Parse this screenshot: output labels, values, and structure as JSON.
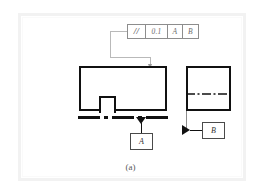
{
  "figure": {
    "caption": "(a)",
    "background_color": "#ffffff",
    "line_color": "#111111",
    "frame_color": "#f2f2f2"
  },
  "feature_control_frame": {
    "name": "parallelism-feature-control-frame",
    "cells": [
      {
        "key": "symbol",
        "label": "//",
        "icon": "parallelism-symbol"
      },
      {
        "key": "tolerance",
        "label": "0.1",
        "icon": "tolerance-value"
      },
      {
        "key": "primary_datum",
        "label": "A",
        "icon": "datum-reference"
      },
      {
        "key": "secondary_datum",
        "label": "B",
        "icon": "datum-reference"
      }
    ],
    "symbol": "//",
    "tolerance": "0.1",
    "primary_datum": "A",
    "secondary_datum": "B"
  },
  "views": {
    "front": {
      "name": "front-view",
      "shape": "rectangle-with-bottom-notch",
      "notch": "upward-tab"
    },
    "side": {
      "name": "side-view",
      "shape": "rectangle",
      "centerline": "horizontal-dash-dot"
    }
  },
  "datums": {
    "a": {
      "label": "A",
      "indicator": "filled-triangle-down",
      "attached_to": "datum-a-chain-line"
    },
    "b": {
      "label": "B",
      "indicator": "filled-triangle-right",
      "attached_to": "side-view-left-edge"
    }
  },
  "annotations": {
    "leader_label": "leader-line-to-top-surface",
    "datum_a_line_label": "datum-a-chain-line"
  }
}
